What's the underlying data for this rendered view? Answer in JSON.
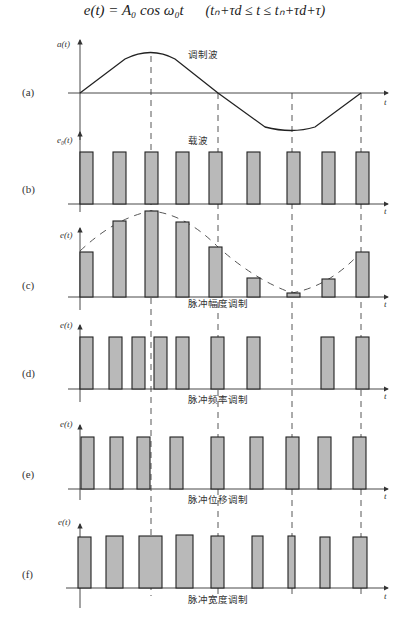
{
  "formula": {
    "main": "e(t) = A₀ cos ω₀t",
    "condition": "(tₙ+τd ≤ t ≤ tₙ+τd+τ)"
  },
  "panels": [
    {
      "id": "a",
      "label": "(a)",
      "ylabel": "a(t)",
      "xlabel": "t",
      "title": "调制波",
      "type": "modulating-wave"
    },
    {
      "id": "b",
      "label": "(b)",
      "ylabel": "e₀(t)",
      "xlabel": "t",
      "title": "载波",
      "type": "carrier"
    },
    {
      "id": "c",
      "label": "(c)",
      "ylabel": "e(t)",
      "xlabel": "t",
      "title": "脉冲幅度调制",
      "type": "PAM"
    },
    {
      "id": "d",
      "label": "(d)",
      "ylabel": "e(t)",
      "xlabel": "t",
      "title": "脉冲频率调制",
      "type": "PFM"
    },
    {
      "id": "e",
      "label": "(e)",
      "ylabel": "e(t)",
      "xlabel": "t",
      "title": "脉冲位移调制",
      "type": "PPM"
    },
    {
      "id": "f",
      "label": "(f)",
      "ylabel": "e(t)",
      "xlabel": "t",
      "title": "脉冲宽度调制",
      "type": "PWM"
    }
  ],
  "caption": "",
  "colors": {
    "pulse_fill": "#b9b9b9",
    "stroke": "#222222",
    "background": "#ffffff"
  }
}
